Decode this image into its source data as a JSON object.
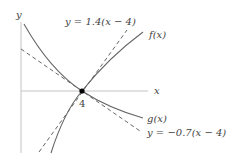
{
  "diagram": {
    "axes": {
      "x_label": "x",
      "y_label": "y"
    },
    "point": {
      "label": "4",
      "x": 4,
      "y": 0
    },
    "curves": [
      {
        "name": "f(x)",
        "style": "solid",
        "note": "increasing curve through (4,0)"
      },
      {
        "name": "g(x)",
        "style": "solid",
        "note": "decreasing curve through (4,0)"
      }
    ],
    "tangent_lines": [
      {
        "label": "y = 1.4(x − 4)",
        "slope": 1.4,
        "style": "dashed",
        "tangent_to": "f(x)"
      },
      {
        "label": "y = −0.7(x − 4)",
        "slope": -0.7,
        "style": "dashed",
        "tangent_to": "g(x)"
      }
    ],
    "colors": {
      "curve": "#555555",
      "axis": "#bbbbbb",
      "point": "#000000"
    }
  }
}
